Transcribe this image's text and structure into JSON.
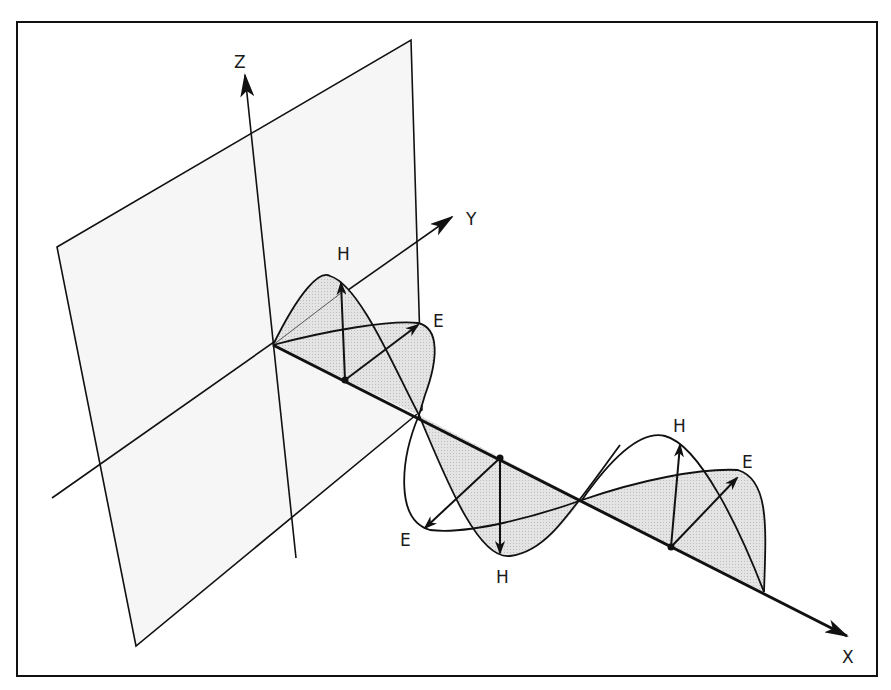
{
  "figure": {
    "colors": {
      "line": "#111111",
      "plane_fill": "#f5f5f5",
      "lobe_fill": "#dcdcdc",
      "background": "#ffffff"
    },
    "axes": {
      "x_label": "X",
      "y_label": "Y",
      "z_label": "Z"
    },
    "vector_labels": {
      "h1": "H",
      "e1": "E",
      "e2": "E",
      "h2": "H",
      "h3": "H",
      "e3": "E"
    }
  }
}
